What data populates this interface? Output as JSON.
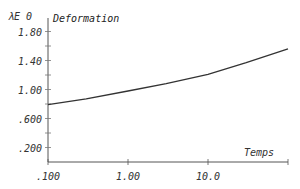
{
  "chart_data": {
    "type": "line",
    "title": "Deformation",
    "xlabel": "Temps",
    "ylabel": "λE 0",
    "xscale": "log",
    "xlim": [
      0.1,
      100
    ],
    "ylim": [
      0,
      1.9
    ],
    "grid": false,
    "x_ticks": [
      ".100",
      "1.00",
      "10.0"
    ],
    "y_ticks": [
      ".200",
      ".600",
      "1.00",
      "1.40",
      "1.80"
    ],
    "series": [
      {
        "name": "Deformation",
        "x": [
          0.1,
          0.3,
          1.0,
          3.0,
          10.0,
          30.0,
          100.0
        ],
        "y": [
          0.79,
          0.87,
          0.98,
          1.08,
          1.21,
          1.37,
          1.56
        ]
      }
    ]
  },
  "labels": {
    "title": "Deformation",
    "xlabel": "Temps",
    "ylabel": "λE 0",
    "x_ticks": [
      ".100",
      "1.00",
      "10.0"
    ],
    "y_ticks": [
      ".200",
      ".600",
      "1.00",
      "1.40",
      "1.80"
    ]
  }
}
